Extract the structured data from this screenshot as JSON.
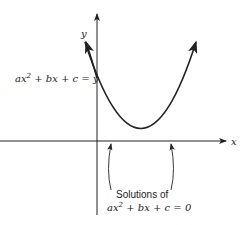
{
  "diagram": {
    "axes": {
      "x_label": "x",
      "y_label": "y"
    },
    "curve_label": {
      "text_prefix": "ax",
      "exponent": "2",
      "text_suffix": " + bx + c = y"
    },
    "roots_caption": {
      "line1": "Solutions of",
      "line2_prefix": "ax",
      "line2_exponent": "2",
      "line2_suffix": " + bx + c = 0"
    },
    "colors": {
      "stroke": "#222222",
      "background": "#ffffff"
    }
  }
}
